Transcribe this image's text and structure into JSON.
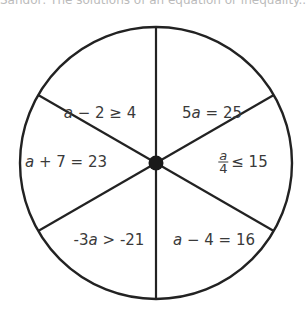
{
  "header": {
    "cutoff_text": "Sandor: The solutions of an equation or inequality...",
    "cutoff_right": "."
  },
  "wheel": {
    "center": [
      156,
      163
    ],
    "radius": 136,
    "line_color": "#222222",
    "hub_radius": 7,
    "sectors": [
      {
        "id": "top-left",
        "variable": "a",
        "rest": " − 2 ≥ 4",
        "position": [
          100,
          113
        ]
      },
      {
        "id": "top-right",
        "prefix": "5",
        "variable": "a",
        "rest": " = 25",
        "position": [
          212,
          113
        ]
      },
      {
        "id": "right",
        "fraction": {
          "numerator": "a",
          "denominator": "4"
        },
        "rest": "≤ 15",
        "position": [
          243,
          162
        ]
      },
      {
        "id": "left",
        "variable": "a",
        "rest": " + 7 = 23",
        "position": [
          66,
          162
        ]
      },
      {
        "id": "bottom-left",
        "prefix": "-3",
        "variable": "a",
        "rest": " > -21",
        "position": [
          109,
          240
        ]
      },
      {
        "id": "bottom-right",
        "variable": "a",
        "rest": " − 4 = 16",
        "position": [
          214,
          240
        ]
      }
    ]
  }
}
